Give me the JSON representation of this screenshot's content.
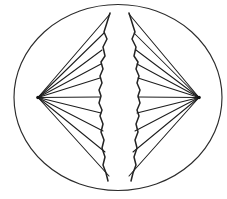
{
  "figure": {
    "background_color": "#ffffff",
    "line_color": "#232323",
    "canvas": {
      "width": 227,
      "height": 199
    }
  },
  "cell": {
    "label": "cell-membrane",
    "shape": "ellipse",
    "center_x": 118,
    "center_y": 97.5,
    "radius_x": 104,
    "radius_y": 93,
    "stroke": "#2b2b2b",
    "stroke_width": 1.15,
    "fill": "#ffffff"
  },
  "poles": [
    {
      "name": "left-pole",
      "x": 38,
      "y": 97.5,
      "dot_radius": 1.8,
      "fill": "#101010"
    },
    {
      "name": "right-pole",
      "x": 199,
      "y": 97.5,
      "dot_radius": 1.8,
      "fill": "#101010"
    }
  ],
  "left_fibers": {
    "origin_x": 38,
    "origin_y": 97.5,
    "count": 10,
    "endpoints": [
      {
        "x": 110,
        "y": 14
      },
      {
        "x": 104,
        "y": 33
      },
      {
        "x": 102,
        "y": 50
      },
      {
        "x": 101,
        "y": 64
      },
      {
        "x": 100,
        "y": 78
      },
      {
        "x": 100,
        "y": 97
      },
      {
        "x": 101,
        "y": 113
      },
      {
        "x": 103,
        "y": 131
      },
      {
        "x": 105,
        "y": 152
      },
      {
        "x": 109,
        "y": 176
      }
    ]
  },
  "right_fibers": {
    "origin_x": 199,
    "origin_y": 97.5,
    "count": 10,
    "endpoints": [
      {
        "x": 129,
        "y": 14
      },
      {
        "x": 134,
        "y": 33
      },
      {
        "x": 136,
        "y": 50
      },
      {
        "x": 137,
        "y": 64
      },
      {
        "x": 138,
        "y": 78
      },
      {
        "x": 138,
        "y": 97
      },
      {
        "x": 137,
        "y": 113
      },
      {
        "x": 135,
        "y": 131
      },
      {
        "x": 133,
        "y": 152
      },
      {
        "x": 129,
        "y": 176
      }
    ]
  },
  "chromatids": [
    {
      "name": "left-chromatid",
      "path": "M110,13 L104,32 L107,39 L103,47 L105,56 L101,62 L103,69 L100,76 L102,83 L99,90 L101,96 L99,103 L102,110 L100,116 L103,124 L101,132 L104,140 L102,148 L105,157 L103,165 L106,173 L108,181"
    },
    {
      "name": "right-chromatid",
      "path": "M129,13 L135,32 L132,39 L136,47 L134,56 L138,62 L136,69 L139,76 L137,83 L140,90 L138,96 L140,103 L137,110 L139,116 L136,124 L138,132 L135,140 L137,148 L134,157 L136,165 L133,173 L131,181"
    }
  ]
}
